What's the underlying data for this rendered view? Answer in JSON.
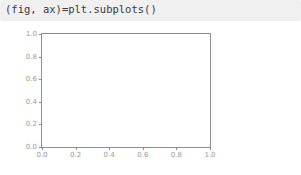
{
  "code_cell": {
    "text": "(fig, ax)=plt.subplots()",
    "background_color": "#f0f0f0",
    "text_color": "#3a3a3a"
  },
  "chart_data": {
    "type": "line",
    "title": "",
    "subtitle": "",
    "xlabel": "",
    "ylabel": "",
    "series": [],
    "x": [],
    "values": [],
    "xlim": [
      0.0,
      1.0
    ],
    "ylim": [
      0.0,
      1.0
    ],
    "xticks": [
      "0.0",
      "0.2",
      "0.4",
      "0.6",
      "0.8",
      "1.0"
    ],
    "xtick_values": [
      0.0,
      0.2,
      0.4,
      0.6,
      0.8,
      1.0
    ],
    "yticks": [
      "0.0",
      "0.2",
      "0.4",
      "0.6",
      "0.8",
      "1.0"
    ],
    "ytick_values": [
      0.0,
      0.2,
      0.4,
      0.6,
      0.8,
      1.0
    ],
    "grid": false,
    "legend": null,
    "legend_position": "none",
    "annotations": [],
    "empty": true,
    "spine_color": "#8d8d8d",
    "tick_label_color": "#9a9a9a",
    "plot_background": "#ffffff",
    "figure_background": "#ffffff"
  }
}
